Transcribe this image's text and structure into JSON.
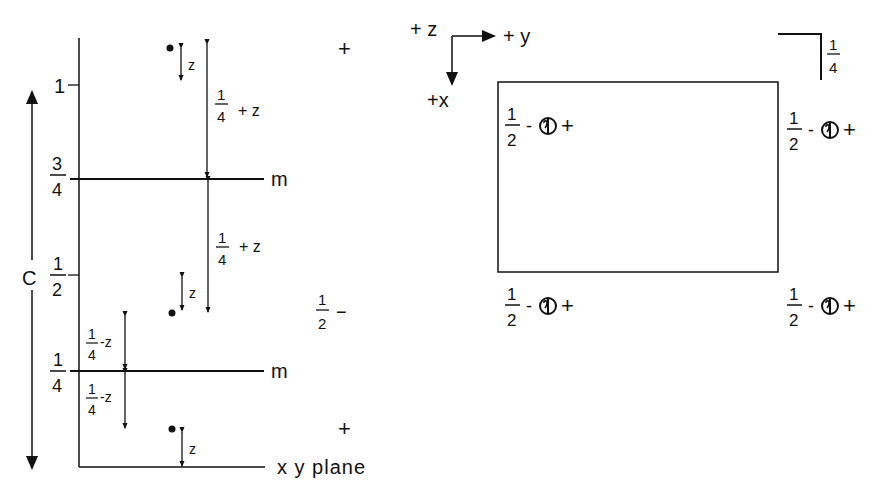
{
  "colors": {
    "ink": "#111111",
    "background": "#ffffff"
  },
  "left_panel": {
    "axis_label": "C",
    "levels": [
      {
        "num": "1",
        "den": ""
      },
      {
        "num": "3",
        "den": "4"
      },
      {
        "num": "1",
        "den": "2"
      },
      {
        "num": "1",
        "den": "4"
      }
    ],
    "mirror_label_upper": "m",
    "mirror_label_lower": "m",
    "base_label": "x y plane",
    "z_label": "z",
    "upper_distance": {
      "num": "1",
      "den": "4",
      "suffix": "+ z"
    },
    "middle_distance": {
      "num": "1",
      "den": "4",
      "suffix": "+ z"
    },
    "lower_distance_above": {
      "num": "1",
      "den": "4",
      "suffix": "-z"
    },
    "lower_distance_below": {
      "num": "1",
      "den": "4",
      "suffix": "-z"
    },
    "height_signs": [
      {
        "text": "+"
      },
      {
        "num": "1",
        "den": "2",
        "suffix": "−"
      },
      {
        "text": "+"
      }
    ]
  },
  "right_panel": {
    "axes": {
      "z": "+ z",
      "y": "+ y",
      "x": "+x"
    },
    "quarter_marker": {
      "num": "1",
      "den": "4"
    },
    "corner_labels": [
      {
        "num": "1",
        "den": "2",
        "minus": "-",
        "plus": "+"
      },
      {
        "num": "1",
        "den": "2",
        "minus": "-",
        "plus": "+"
      },
      {
        "num": "1",
        "den": "2",
        "minus": "-",
        "plus": "+"
      },
      {
        "num": "1",
        "den": "2",
        "minus": "-",
        "plus": "+"
      }
    ],
    "corner_symbol": "circle-with-comma"
  }
}
